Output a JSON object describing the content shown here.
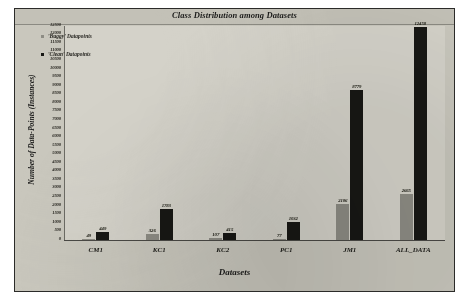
{
  "chart_data": {
    "type": "bar",
    "title": "Class Distribution among Datasets",
    "xlabel": "Datasets",
    "ylabel": "Number of Data-Points (Instances)",
    "categories": [
      "CM1",
      "KC1",
      "KC2",
      "PC1",
      "JM1",
      "ALL_DATA"
    ],
    "series": [
      {
        "name": "'Buggy' Datapoints",
        "color": "#8d8c84",
        "values": [
          49,
          326,
          107,
          77,
          2106,
          2665
        ]
      },
      {
        "name": "'Clean' Datapoints",
        "color": "#171714",
        "values": [
          449,
          1783,
          415,
          1032,
          8779,
          12458
        ]
      }
    ],
    "ylim": [
      0,
      12500
    ],
    "ytick_step": 500,
    "yticks": [
      "12500",
      "12000",
      "11500",
      "11000",
      "10500",
      "10000",
      "9500",
      "9000",
      "8500",
      "8000",
      "7500",
      "7000",
      "6500",
      "6000",
      "5500",
      "5000",
      "4500",
      "4000",
      "3500",
      "3000",
      "2500",
      "2000",
      "1500",
      "1000",
      "500",
      "0"
    ],
    "grid": false,
    "legend_position": "upper-left-inside"
  },
  "figure": {
    "background_color": "#c9c7bd",
    "plot_background_color": "#d4d2c9",
    "border_color": "#2b2b29"
  }
}
